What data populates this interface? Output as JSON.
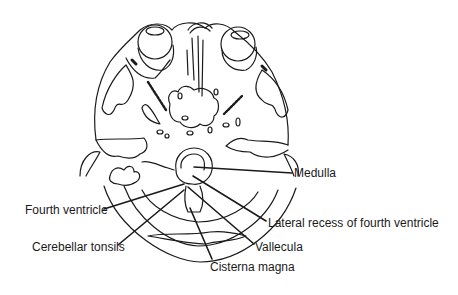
{
  "figure": {
    "type": "axial CT line drawing of skull base / posterior fossa",
    "line_color": "#1a1a1a",
    "background": "#ffffff"
  },
  "labels": [
    {
      "id": "medulla",
      "text": "Medulla",
      "x": 294,
      "y": 166
    },
    {
      "id": "fourth-ventricle",
      "text": "Fourth ventricle",
      "x": 25,
      "y": 203
    },
    {
      "id": "lateral-recess",
      "text": "Lateral recess of fourth ventricle",
      "x": 268,
      "y": 216
    },
    {
      "id": "cerebellar-tonsils",
      "text": "Cerebellar tonsils",
      "x": 32,
      "y": 240
    },
    {
      "id": "vallecula",
      "text": "Vallecula",
      "x": 255,
      "y": 240
    },
    {
      "id": "cisterna-magna",
      "text": "Cisterna magna",
      "x": 210,
      "y": 260
    }
  ]
}
